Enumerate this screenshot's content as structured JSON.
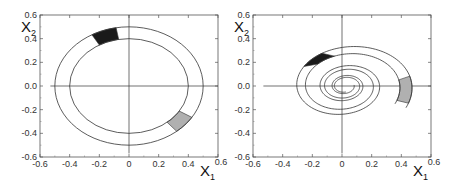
{
  "chart_data": [
    {
      "type": "line",
      "title": "",
      "description": "Phase portrait: closed concentric orbits (annulus between two ellipses) with a dark region near top and a gray region near lower right",
      "xlabel": "X1",
      "ylabel": "X2",
      "xlim": [
        -0.6,
        0.6
      ],
      "ylim": [
        -0.6,
        0.6
      ],
      "xticks": [
        "-0.6",
        "-0.4",
        "-0.2",
        "0",
        "0.2",
        "0.4",
        "0.6"
      ],
      "yticks": [
        "0.6",
        "0.4",
        "0.2",
        "0.0",
        "-0.2",
        "-0.4",
        "-0.6"
      ],
      "grid": false,
      "series": [
        {
          "name": "outer orbit",
          "shape": "ellipse",
          "cx": 0,
          "cy": 0,
          "rx": 0.5,
          "ry": 0.5
        },
        {
          "name": "inner orbit",
          "shape": "ellipse",
          "cx": 0,
          "cy": 0,
          "rx": 0.4,
          "ry": 0.4
        }
      ],
      "regions": [
        {
          "name": "dark region",
          "color": "#1a1a1a",
          "angle_start_deg": 100,
          "angle_end_deg": 120
        },
        {
          "name": "gray region",
          "color": "#b0b0b0",
          "angle_start_deg": -50,
          "angle_end_deg": -32
        }
      ]
    },
    {
      "type": "line",
      "title": "",
      "description": "Phase portrait: two inward spiraling trajectories bounding a band, dark region near top-left, gray region near lower right",
      "xlabel": "X1",
      "ylabel": "X2",
      "xlim": [
        -0.6,
        0.6
      ],
      "ylim": [
        -0.6,
        0.6
      ],
      "xticks": [
        "-0.6",
        "-0.4",
        "-0.2",
        "0",
        "0.2",
        "0.4",
        "0.6"
      ],
      "yticks": [
        "0.6",
        "0.4",
        "0.2",
        "0.0",
        "-0.2",
        "-0.4",
        "-0.6"
      ],
      "grid": false,
      "series": [
        {
          "name": "outer spiral",
          "shape": "spiral",
          "r0": 0.5,
          "decay": 0.105,
          "theta_start_deg": -30,
          "turns": 3.1
        },
        {
          "name": "inner spiral",
          "shape": "spiral",
          "r0": 0.41,
          "decay": 0.105,
          "theta_start_deg": -30,
          "turns": 2.85
        }
      ],
      "regions": [
        {
          "name": "dark region",
          "color": "#1a1a1a"
        },
        {
          "name": "gray region",
          "color": "#b0b0b0"
        }
      ]
    }
  ],
  "panels": [
    {
      "xlabel_main": "X",
      "xlabel_sub": "1",
      "ylabel_main": "X",
      "ylabel_sub": "2"
    },
    {
      "xlabel_main": "X",
      "xlabel_sub": "1",
      "ylabel_main": "X",
      "ylabel_sub": "2"
    }
  ]
}
